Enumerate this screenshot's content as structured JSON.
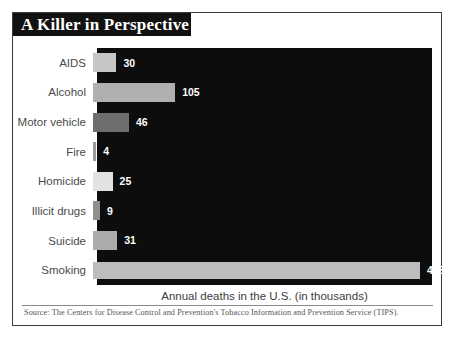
{
  "figure": {
    "title": "A Killer in Perspective",
    "caption": "Annual deaths in the U.S. (in thousands)",
    "source": "Source: The Centers for Disease Control and Prevention's Tobacco Information and Prevention Service (TIPS).",
    "colors": {
      "plot_background": "#0d0d0d",
      "title_banner": "#111111",
      "title_text": "#ffffff",
      "frame_border": "#3c3c3c",
      "label_text": "#4a4a4a",
      "value_text": "#ffffff",
      "page_background": "#ffffff"
    }
  },
  "chart_data": {
    "type": "bar",
    "orientation": "horizontal",
    "title": "A Killer in Perspective",
    "xlabel": "Annual deaths in the U.S. (in thousands)",
    "ylabel": "",
    "xlim": [
      0,
      418
    ],
    "grid": false,
    "legend": "none",
    "units": "thousands of deaths per year",
    "categories": [
      "AIDS",
      "Alcohol",
      "Motor vehicle",
      "Fire",
      "Homicide",
      "Illicit drugs",
      "Suicide",
      "Smoking"
    ],
    "values": [
      30,
      105,
      46,
      4,
      25,
      9,
      31,
      418
    ],
    "bars": [
      {
        "label": "AIDS",
        "value": 30,
        "value_label": "30",
        "color": "#c6c6c6"
      },
      {
        "label": "Alcohol",
        "value": 105,
        "value_label": "105",
        "color": "#b0b0b0"
      },
      {
        "label": "Motor vehicle",
        "value": 46,
        "value_label": "46",
        "color": "#6e6e6e"
      },
      {
        "label": "Fire",
        "value": 4,
        "value_label": "4",
        "color": "#9a9a9a"
      },
      {
        "label": "Homicide",
        "value": 25,
        "value_label": "25",
        "color": "#e2e2e2"
      },
      {
        "label": "Illicit drugs",
        "value": 9,
        "value_label": "9",
        "color": "#8f8f8f"
      },
      {
        "label": "Suicide",
        "value": 31,
        "value_label": "31",
        "color": "#acacac"
      },
      {
        "label": "Smoking",
        "value": 418,
        "value_label": "418",
        "color": "#bdbdbd"
      }
    ]
  }
}
